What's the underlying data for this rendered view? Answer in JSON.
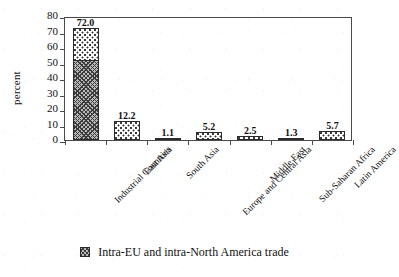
{
  "chart_data": {
    "type": "bar",
    "title": "",
    "xlabel": "",
    "ylabel": "percent",
    "ylim": [
      0,
      80
    ],
    "yticks": [
      0,
      10,
      20,
      30,
      40,
      50,
      60,
      70,
      80
    ],
    "grid": false,
    "stacked": true,
    "legend_position": "bottom-center",
    "categories": [
      "Industrial Countries",
      "East Asia",
      "South Asia",
      "Europe and Central Asia",
      "Middle East",
      "Sub-Saharan Africa",
      "Latin America"
    ],
    "values": [
      72.0,
      12.2,
      1.1,
      5.2,
      2.5,
      1.3,
      5.7
    ],
    "value_labels": [
      "72.0",
      "12.2",
      "1.1",
      "5.2",
      "2.5",
      "1.3",
      "5.7"
    ],
    "series": [
      {
        "name": "Intra-EU and intra-North America trade",
        "pattern": "dark-crosshatch",
        "values": [
          52.0,
          0,
          0,
          0,
          0,
          0,
          0
        ]
      },
      {
        "name": "Other trade",
        "pattern": "light-dotted",
        "values": [
          20.0,
          12.2,
          1.1,
          5.2,
          2.5,
          1.3,
          5.7
        ]
      }
    ],
    "legend": [
      {
        "label": "Intra-EU and intra-North America trade",
        "swatch": "dark-crosshatch"
      }
    ]
  }
}
